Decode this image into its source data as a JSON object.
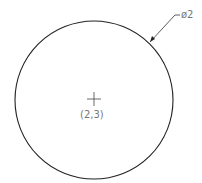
{
  "diagram": {
    "type": "circle-dimension-drawing",
    "circle": {
      "center_label": "(2,3)",
      "diameter_label": "ø2"
    },
    "colors": {
      "line": "#222222",
      "text": "#777777"
    }
  }
}
